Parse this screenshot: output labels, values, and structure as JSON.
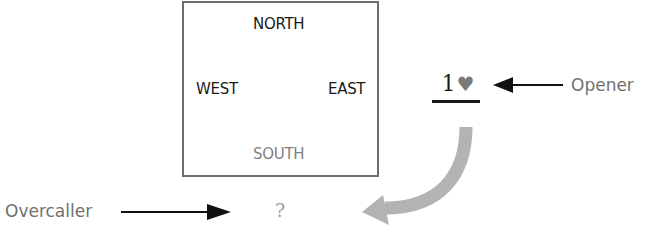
{
  "table": {
    "north": "NORTH",
    "west": "WEST",
    "east": "EAST",
    "south": "SOUTH"
  },
  "bid": {
    "level": "1",
    "suit": "♥",
    "suit_name": "heart"
  },
  "labels": {
    "opener": "Opener",
    "overcaller": "Overcaller",
    "question": "?"
  },
  "colors": {
    "text_dark": "#1a1a1a",
    "text_gray": "#707070",
    "south_gray": "#808080",
    "curved_arrow": "#b3b3b3",
    "arrow_black": "#111111",
    "box_border": "#6e6e6e"
  }
}
